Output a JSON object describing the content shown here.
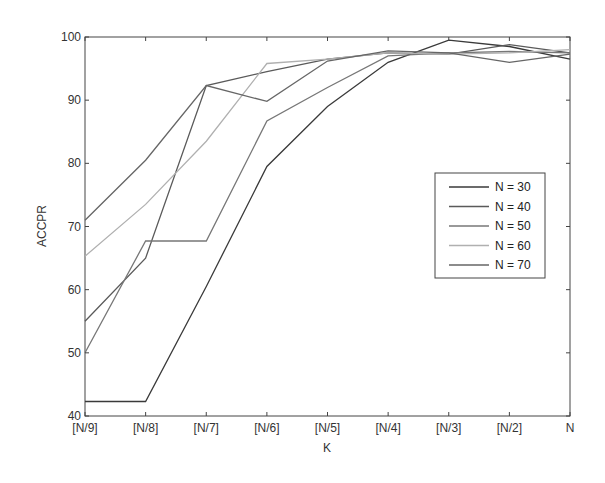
{
  "chart_data": {
    "type": "line",
    "title": "",
    "xlabel": "K",
    "ylabel": "ACCPR",
    "categories": [
      "[N/9]",
      "[N/8]",
      "[N/7]",
      "[N/6]",
      "[N/5]",
      "[N/4]",
      "[N/3]",
      "[N/2]",
      "N"
    ],
    "ylim": [
      40,
      100
    ],
    "yticks": [
      40,
      50,
      60,
      70,
      80,
      90,
      100
    ],
    "grid": false,
    "legend_position": "right-center",
    "series": [
      {
        "name": "N = 30",
        "color": "#3a3a3a",
        "values": [
          42.3,
          42.3,
          60.5,
          79.5,
          89,
          96,
          99.5,
          98.5,
          96.5
        ]
      },
      {
        "name": "N = 40",
        "color": "#5a5a5a",
        "values": [
          55,
          65,
          92.3,
          94.5,
          96.5,
          97.5,
          97.3,
          98.8,
          97.5
        ]
      },
      {
        "name": "N = 50",
        "color": "#777777",
        "values": [
          50,
          67.7,
          67.7,
          86.7,
          92,
          97,
          97.5,
          97.7,
          97.5
        ]
      },
      {
        "name": "N = 60",
        "color": "#b0b0b0",
        "values": [
          65.3,
          73.5,
          83.5,
          95.8,
          96.5,
          97.5,
          97.3,
          97.5,
          98
        ]
      },
      {
        "name": "N = 70",
        "color": "#666666",
        "values": [
          71,
          80.5,
          92.3,
          89.8,
          96.2,
          97.8,
          97.5,
          96,
          97.3
        ]
      }
    ]
  }
}
